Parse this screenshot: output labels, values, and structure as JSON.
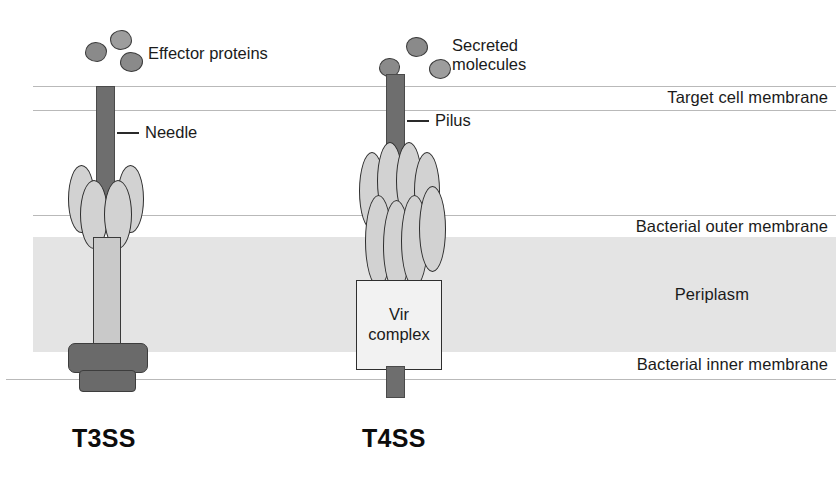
{
  "figure": {
    "width": 836,
    "height": 479,
    "background": "#ffffff"
  },
  "colors": {
    "shaft_fill": "#6e6e6e",
    "shaft_stroke": "#4a4a4a",
    "oval_fill": "#d2d2d2",
    "oval_stroke": "#2e2e2e",
    "stem_fill": "#c9c9c9",
    "base_fill": "#6a6a6a",
    "blob_fill": "#8a8a8a",
    "periplasm_fill": "#e4e4e4",
    "membrane_line": "#b9b9b9",
    "text": "#1b1b1b",
    "page_background": "#ffffff"
  },
  "region_labels": {
    "target_cell_membrane": "Target cell membrane",
    "bacterial_outer_membrane": "Bacterial outer membrane",
    "periplasm": "Periplasm",
    "bacterial_inner_membrane": "Bacterial inner membrane"
  },
  "systems": [
    {
      "id": "t3ss",
      "name": "T3SS",
      "cargo_label": "Effector proteins",
      "shaft_label": "Needle",
      "shaft_type": "needle",
      "ring_oval_count": 4,
      "has_vir_complex": false,
      "base_block_count": 2
    },
    {
      "id": "t4ss",
      "name": "T4SS",
      "cargo_label_line1": "Secreted",
      "cargo_label_line2": "molecules",
      "shaft_label": "Pilus",
      "shaft_type": "pilus",
      "ring_oval_count": 8,
      "has_vir_complex": true,
      "vir_complex_line1": "Vir",
      "vir_complex_line2": "complex",
      "base_block_count": 0
    }
  ],
  "geometry": {
    "membrane_lines_y": [
      86,
      110,
      215,
      379
    ],
    "periplasm": {
      "x": 33,
      "y": 237,
      "width": 803,
      "height": 115
    },
    "t3ss_center_x": 105,
    "t4ss_center_x": 395
  }
}
